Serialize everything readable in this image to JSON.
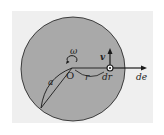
{
  "figure": {
    "colors": {
      "panel": "#efefef",
      "disk": "#a9a9a9",
      "stroke": "#1a1a1a"
    },
    "labels": {
      "omega": "ω",
      "origin": "O",
      "radius": "r",
      "arc": "a",
      "velocity": "v",
      "displacement": "dr",
      "direction": "de"
    }
  }
}
